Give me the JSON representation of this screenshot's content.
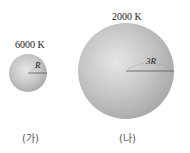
{
  "stars": [
    {
      "id": "ga",
      "temperature_label": "6000 K",
      "radius_label": "R",
      "caption": "(가)",
      "radius_relative": 1,
      "temperature_K": 6000
    },
    {
      "id": "na",
      "temperature_label": "2000 K",
      "radius_label": "3R",
      "caption": "(나)",
      "radius_relative": 3,
      "temperature_K": 2000
    }
  ],
  "colors": {
    "star_light": "#e6e6e6",
    "star_mid": "#c4c4c4",
    "star_edge": "#a8a8a8",
    "radius_line": "#555555"
  }
}
